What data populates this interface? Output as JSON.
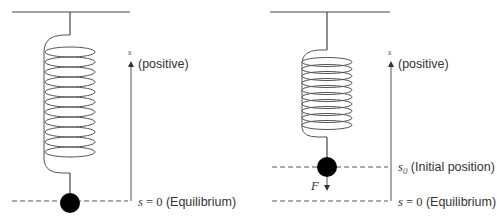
{
  "figure": {
    "left": {
      "axis_label": "s",
      "axis_direction_label": "(positive)",
      "equilibrium": {
        "symbol": "s",
        "equals": " = 0",
        "text": " (Equilibrium)"
      }
    },
    "right": {
      "axis_label": "s",
      "axis_direction_label": "(positive)",
      "initial_position": {
        "symbol": "s",
        "subscript": "0",
        "text": " (Initial position)"
      },
      "equilibrium": {
        "symbol": "s",
        "equals": " = 0",
        "text": " (Equilibrium)"
      },
      "force_label": "F"
    },
    "colors": {
      "line": "#444444",
      "mass": "#000000",
      "background": "#ffffff"
    }
  }
}
